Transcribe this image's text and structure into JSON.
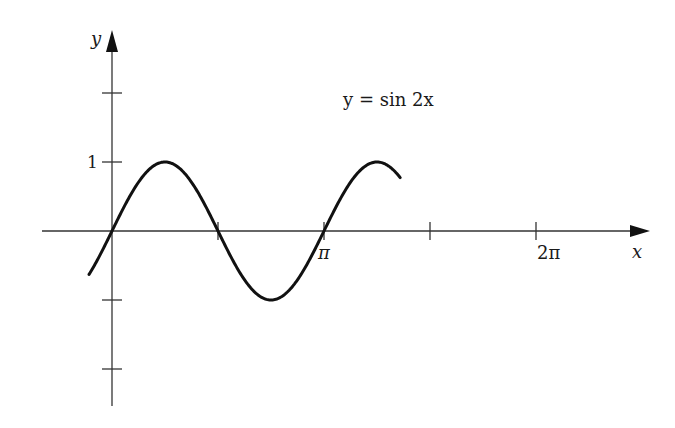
{
  "chart_data": {
    "type": "line",
    "title": "y = sin 2x",
    "xlabel": "x",
    "ylabel": "y",
    "function": "sin(2x)",
    "x_range": [
      -0.34,
      4.27
    ],
    "y_tick_labels": [
      "1"
    ],
    "y_ticks": [
      -2,
      -1,
      1,
      2
    ],
    "x_tick_labels": [
      "π",
      "2π"
    ],
    "x_ticks": [
      1.5708,
      3.1416,
      4.7124,
      6.2832
    ],
    "x": [
      -0.34,
      0,
      0.785,
      1.571,
      2.356,
      3.142,
      3.927,
      4.712,
      5.498,
      6.283,
      6.46
    ],
    "values": [
      -0.63,
      0,
      1,
      0,
      -1,
      0,
      1,
      0,
      -1,
      0,
      0.34
    ],
    "grid": false,
    "legend": null,
    "colors": {
      "curve": "#111111",
      "axes": "#333333"
    }
  },
  "labels": {
    "equation": "y = sin 2x",
    "x_axis": "x",
    "y_axis": "y",
    "y_one": "1",
    "pi": "π",
    "two_pi": "2π"
  }
}
